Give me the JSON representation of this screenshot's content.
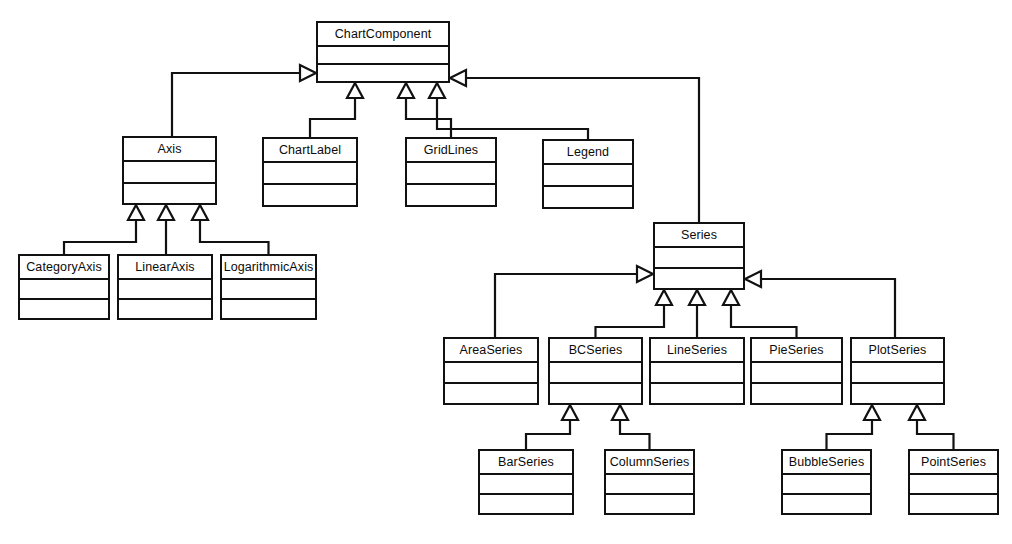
{
  "diagram": {
    "kind": "uml-class-diagram",
    "background_color": "#ffffff",
    "line_color": "#111111",
    "text_color": "#0b0b0b",
    "classes": [
      {
        "id": "chartcomponent",
        "name": "ChartComponent",
        "x": 316,
        "y": 21,
        "w": 134,
        "h": 62,
        "name_h": 24
      },
      {
        "id": "axis",
        "name": "Axis",
        "x": 122,
        "y": 136,
        "w": 95,
        "h": 69,
        "name_h": 24
      },
      {
        "id": "chartlabel",
        "name": "ChartLabel",
        "x": 262,
        "y": 137,
        "w": 96,
        "h": 70,
        "name_h": 24
      },
      {
        "id": "gridlines",
        "name": "GridLines",
        "x": 405,
        "y": 137,
        "w": 92,
        "h": 70,
        "name_h": 24
      },
      {
        "id": "legend",
        "name": "Legend",
        "x": 542,
        "y": 139,
        "w": 92,
        "h": 70,
        "name_h": 24
      },
      {
        "id": "series",
        "name": "Series",
        "x": 653,
        "y": 222,
        "w": 92,
        "h": 68,
        "name_h": 24
      },
      {
        "id": "categoryaxis",
        "name": "CategoryAxis",
        "x": 18,
        "y": 254,
        "w": 92,
        "h": 66,
        "name_h": 24
      },
      {
        "id": "linearaxis",
        "name": "LinearAxis",
        "x": 117,
        "y": 254,
        "w": 96,
        "h": 66,
        "name_h": 24
      },
      {
        "id": "logarithmicaxis",
        "name": "LogarithmicAxis",
        "x": 220,
        "y": 254,
        "w": 97,
        "h": 66,
        "name_h": 24
      },
      {
        "id": "areaseries",
        "name": "AreaSeries",
        "x": 443,
        "y": 337,
        "w": 96,
        "h": 68,
        "name_h": 24
      },
      {
        "id": "bcseries",
        "name": "BCSeries",
        "x": 548,
        "y": 337,
        "w": 95,
        "h": 68,
        "name_h": 24
      },
      {
        "id": "lineseries",
        "name": "LineSeries",
        "x": 649,
        "y": 337,
        "w": 96,
        "h": 68,
        "name_h": 24
      },
      {
        "id": "pieseries",
        "name": "PieSeries",
        "x": 750,
        "y": 337,
        "w": 93,
        "h": 68,
        "name_h": 24
      },
      {
        "id": "plotseries",
        "name": "PlotSeries",
        "x": 850,
        "y": 337,
        "w": 95,
        "h": 68,
        "name_h": 24
      },
      {
        "id": "barseries",
        "name": "BarSeries",
        "x": 478,
        "y": 449,
        "w": 96,
        "h": 66,
        "name_h": 24
      },
      {
        "id": "columnseries",
        "name": "ColumnSeries",
        "x": 604,
        "y": 449,
        "w": 91,
        "h": 66,
        "name_h": 24
      },
      {
        "id": "bubbleseries",
        "name": "BubbleSeries",
        "x": 781,
        "y": 449,
        "w": 91,
        "h": 66,
        "name_h": 24
      },
      {
        "id": "pointseries",
        "name": "PointSeries",
        "x": 908,
        "y": 449,
        "w": 91,
        "h": 66,
        "name_h": 24
      }
    ],
    "relations": [
      {
        "id": "r1",
        "from": "axis",
        "to": "chartcomponent",
        "type": "association",
        "marker": "open-arrow",
        "label": ""
      },
      {
        "id": "r2",
        "from": "series",
        "to": "chartcomponent",
        "type": "association",
        "marker": "open-arrow",
        "label": ""
      },
      {
        "id": "r3",
        "from": "chartlabel",
        "to": "chartcomponent",
        "type": "generalization",
        "marker": "hollow-triangle",
        "label": ""
      },
      {
        "id": "r4",
        "from": "gridlines",
        "to": "chartcomponent",
        "type": "generalization",
        "marker": "hollow-triangle",
        "label": ""
      },
      {
        "id": "r5",
        "from": "legend",
        "to": "chartcomponent",
        "type": "generalization",
        "marker": "hollow-triangle",
        "label": ""
      },
      {
        "id": "r6",
        "from": "categoryaxis",
        "to": "axis",
        "type": "generalization",
        "marker": "hollow-triangle",
        "label": ""
      },
      {
        "id": "r7",
        "from": "linearaxis",
        "to": "axis",
        "type": "generalization",
        "marker": "hollow-triangle",
        "label": ""
      },
      {
        "id": "r8",
        "from": "logarithmicaxis",
        "to": "axis",
        "type": "generalization",
        "marker": "hollow-triangle",
        "label": ""
      },
      {
        "id": "r9",
        "from": "areaseries",
        "to": "series",
        "type": "association",
        "marker": "open-arrow",
        "label": ""
      },
      {
        "id": "r10",
        "from": "plotseries",
        "to": "series",
        "type": "association",
        "marker": "open-arrow",
        "label": ""
      },
      {
        "id": "r11",
        "from": "bcseries",
        "to": "series",
        "type": "generalization",
        "marker": "hollow-triangle",
        "label": ""
      },
      {
        "id": "r12",
        "from": "lineseries",
        "to": "series",
        "type": "generalization",
        "marker": "hollow-triangle",
        "label": ""
      },
      {
        "id": "r13",
        "from": "pieseries",
        "to": "series",
        "type": "generalization",
        "marker": "hollow-triangle",
        "label": ""
      },
      {
        "id": "r14",
        "from": "barseries",
        "to": "bcseries",
        "type": "generalization",
        "marker": "hollow-triangle",
        "label": ""
      },
      {
        "id": "r15",
        "from": "columnseries",
        "to": "bcseries",
        "type": "generalization",
        "marker": "hollow-triangle",
        "label": ""
      },
      {
        "id": "r16",
        "from": "bubbleseries",
        "to": "plotseries",
        "type": "generalization",
        "marker": "hollow-triangle",
        "label": ""
      },
      {
        "id": "r17",
        "from": "pointseries",
        "to": "plotseries",
        "type": "generalization",
        "marker": "hollow-triangle",
        "label": ""
      }
    ]
  }
}
